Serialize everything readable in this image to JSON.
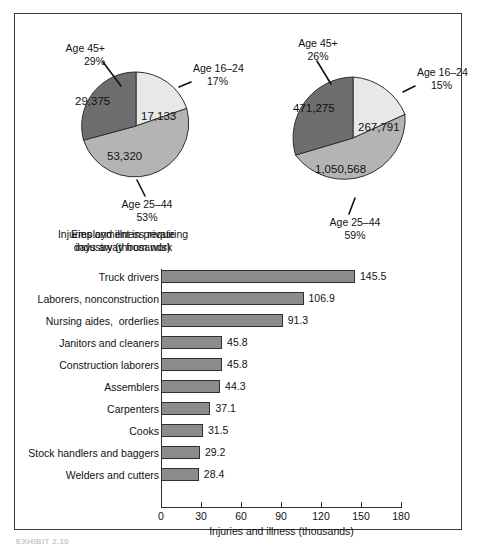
{
  "exhibit": {
    "footer_label": "EXHIBIT 2.10"
  },
  "pies": [
    {
      "id": "employment",
      "caption": "Employment in private\nindustry (thousands)",
      "slices": [
        {
          "age_label": "Age 16–24",
          "percent_label": "17%",
          "value_label": "17,133",
          "percent": 17,
          "value": 17133,
          "shade": "light"
        },
        {
          "age_label": "Age 25–44",
          "percent_label": "53%",
          "value_label": "53,320",
          "percent": 53,
          "value": 53320,
          "shade": "medium"
        },
        {
          "age_label": "Age 45+",
          "percent_label": "29%",
          "value_label": "29,375",
          "percent": 29,
          "value": 29375,
          "shade": "dark"
        }
      ]
    },
    {
      "id": "injuries",
      "caption": "Injuries and illness requiring\ndays away from work",
      "slices": [
        {
          "age_label": "Age 16–24",
          "percent_label": "15%",
          "value_label": "267,791",
          "percent": 15,
          "value": 267791,
          "shade": "light"
        },
        {
          "age_label": "Age 25–44",
          "percent_label": "59%",
          "value_label": "1,050,568",
          "percent": 59,
          "value": 1050568,
          "shade": "medium"
        },
        {
          "age_label": "Age 45+",
          "percent_label": "26%",
          "value_label": "471,275",
          "percent": 26,
          "value": 471275,
          "shade": "dark"
        }
      ]
    }
  ],
  "colors": {
    "slice_light": "#e8e8e8",
    "slice_medium": "#b4b4b4",
    "slice_dark": "#6e6e6e",
    "bar_fill": "#8c8c8c",
    "outline": "#2f2f2f"
  },
  "chart_data": {
    "type": "bar",
    "title": "",
    "xlabel": "Injuries and illness (thousands)",
    "ylabel": "",
    "orientation": "horizontal",
    "xlim": [
      0,
      180
    ],
    "xticks": [
      0,
      30,
      60,
      90,
      120,
      150,
      180
    ],
    "grid": false,
    "legend": "none",
    "categories": [
      "Truck drivers",
      "Laborers, nonconstruction",
      "Nursing aides,  orderlies",
      "Janitors and cleaners",
      "Construction laborers",
      "Assemblers",
      "Carpenters",
      "Cooks",
      "Stock handlers and baggers",
      "Welders and cutters"
    ],
    "values": [
      145.5,
      106.9,
      91.3,
      45.8,
      45.8,
      44.3,
      37.1,
      31.5,
      29.2,
      28.4
    ],
    "value_labels": [
      "145.5",
      "106.9",
      "91.3",
      "45.8",
      "45.8",
      "44.3",
      "37.1",
      "31.5",
      "29.2",
      "28.4"
    ]
  }
}
